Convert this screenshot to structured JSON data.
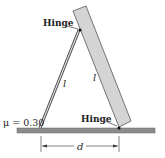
{
  "labels": {
    "hinge_top": "Hinge",
    "hinge_bottom": "Hinge",
    "friction": "μ = 0.30",
    "rod_length": "l",
    "plank_length": "l",
    "distance": "d"
  },
  "colors": {
    "ground": "#8c8c8c",
    "plank": "#d4d4d4",
    "stroke": "#333333"
  }
}
